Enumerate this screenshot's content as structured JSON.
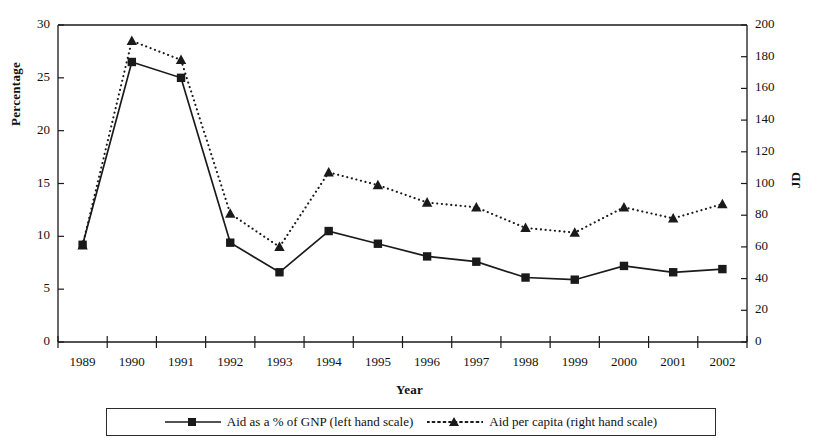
{
  "chart_data": {
    "type": "line",
    "title": "",
    "xlabel": "Year",
    "ylabel": "Percentage",
    "ylabel_right": "JD",
    "categories": [
      "1989",
      "1990",
      "1991",
      "1992",
      "1993",
      "1994",
      "1995",
      "1996",
      "1997",
      "1998",
      "1999",
      "2000",
      "2001",
      "2002"
    ],
    "ylim": [
      0,
      30
    ],
    "ylim_right": [
      0,
      200
    ],
    "yticks": [
      "0",
      "5",
      "10",
      "15",
      "20",
      "25",
      "30"
    ],
    "yticks_right": [
      "0",
      "20",
      "40",
      "60",
      "80",
      "100",
      "120",
      "140",
      "160",
      "180",
      "200"
    ],
    "grid": false,
    "legend_position": "bottom",
    "series": [
      {
        "name": "Aid as a % of GNP (left hand scale)",
        "axis": "left",
        "marker": "square",
        "line_style": "solid",
        "color": "#1a1a1a",
        "values": [
          9.2,
          26.5,
          25.0,
          9.4,
          6.6,
          10.5,
          9.3,
          8.1,
          7.6,
          6.1,
          5.9,
          7.2,
          6.6,
          6.9
        ]
      },
      {
        "name": "Aid per capita (right hand scale)",
        "axis": "right",
        "marker": "triangle",
        "line_style": "dotted",
        "color": "#1a1a1a",
        "values": [
          61,
          190,
          178,
          81,
          60,
          107,
          99,
          88,
          85,
          72,
          69,
          85,
          78,
          87
        ]
      }
    ]
  },
  "legend": {
    "entries": [
      {
        "label": "Aid as a % of GNP (left hand scale)"
      },
      {
        "label": "Aid per capita (right hand scale)"
      }
    ]
  }
}
